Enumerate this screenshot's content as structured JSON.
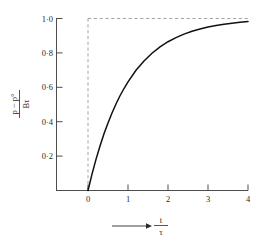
{
  "chart_data": {
    "type": "line",
    "title": "",
    "subtitle": "",
    "xlabel": "t / τ",
    "xlabel_numerator": "t",
    "xlabel_denominator": "τ",
    "xlabel_arrow": "⟶",
    "ylabel": "(p − p°) / Bτ",
    "ylabel_numerator": "p − p°",
    "ylabel_denominator": "Bτ",
    "xlim": [
      -0.35,
      4.0
    ],
    "ylim": [
      -0.06,
      1.04
    ],
    "xticks": [
      0,
      1,
      2,
      3,
      4
    ],
    "xtick_labels": [
      "0",
      "1",
      "2",
      "3",
      "4"
    ],
    "yticks": [
      0.2,
      0.4,
      0.6,
      0.8,
      1.0
    ],
    "ytick_labels": [
      "0·2",
      "0·4",
      "0·6",
      "0·8",
      "1·0"
    ],
    "grid": false,
    "legend": null,
    "series": [
      {
        "name": "1 - exp(-t/τ)",
        "style": "solid",
        "color": "#111111",
        "x": [
          0,
          0.1,
          0.2,
          0.3,
          0.4,
          0.5,
          0.6,
          0.7,
          0.8,
          0.9,
          1.0,
          1.2,
          1.4,
          1.6,
          1.8,
          2.0,
          2.2,
          2.4,
          2.6,
          2.8,
          3.0,
          3.2,
          3.4,
          3.6,
          3.8,
          4.0
        ],
        "y": [
          0.0,
          0.095,
          0.181,
          0.259,
          0.33,
          0.393,
          0.451,
          0.503,
          0.551,
          0.593,
          0.632,
          0.699,
          0.753,
          0.798,
          0.835,
          0.865,
          0.889,
          0.909,
          0.926,
          0.939,
          0.95,
          0.959,
          0.967,
          0.973,
          0.978,
          0.982
        ]
      }
    ],
    "annotations": [
      {
        "name": "asymptote-horizontal",
        "type": "dashed-line",
        "orientation": "horizontal",
        "value": 1.0,
        "color": "#8d8d8d"
      },
      {
        "name": "axis-vertical-at-zero",
        "type": "dashed-line",
        "orientation": "vertical",
        "value": 0.0,
        "color": "#8d8d8d"
      }
    ]
  }
}
